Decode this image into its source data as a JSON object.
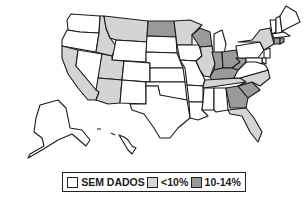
{
  "map": {
    "title": "",
    "region": "United States",
    "categories": [
      {
        "key": "none",
        "label": "SEM DADOS",
        "color": "#ffffff"
      },
      {
        "key": "low",
        "label": "<10%",
        "color": "#d4d4d4"
      },
      {
        "key": "mid",
        "label": "10-14%",
        "color": "#9a9a9a"
      }
    ],
    "states": {
      "WA": "none",
      "OR": "none",
      "CA": "low",
      "NV": "none",
      "ID": "low",
      "MT": "low",
      "WY": "none",
      "UT": "low",
      "AZ": "low",
      "CO": "none",
      "NM": "none",
      "ND": "mid",
      "SD": "none",
      "NE": "none",
      "KS": "none",
      "OK": "none",
      "TX": "none",
      "MN": "low",
      "IA": "none",
      "MO": "none",
      "AR": "none",
      "LA": "none",
      "WI": "mid",
      "IL": "low",
      "MI": "none",
      "IN": "mid",
      "OH": "mid",
      "KY": "mid",
      "TN": "low",
      "MS": "none",
      "AL": "none",
      "GA": "mid",
      "FL": "low",
      "SC": "mid",
      "NC": "low",
      "VA": "none",
      "WV": "mid",
      "PA": "none",
      "NY": "low",
      "VT": "none",
      "NH": "none",
      "ME": "none",
      "MA": "none",
      "CT": "mid",
      "RI": "mid",
      "NJ": "none",
      "DE": "none",
      "MD": "none",
      "AK": "none",
      "HI": "none"
    }
  },
  "legend": {
    "items": [
      {
        "label": "SEM DADOS",
        "color": "#ffffff"
      },
      {
        "label": "<10%",
        "color": "#d4d4d4"
      },
      {
        "label": "10-14%",
        "color": "#9a9a9a"
      }
    ]
  }
}
